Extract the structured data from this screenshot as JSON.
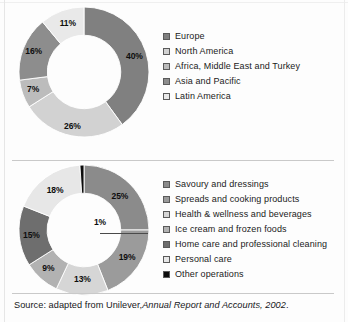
{
  "figure": {
    "source_prefix": "Source: adapted from Unilever,",
    "source_italic": "Annual Report and Accounts, 2002",
    "source_suffix": "."
  },
  "chart_data": [
    {
      "type": "pie",
      "variant": "donut",
      "title": "",
      "name": "turnover-by-region",
      "categories": [
        "Europe",
        "North America",
        "Africa, Middle East and Turkey",
        "Asia and Pacific",
        "Latin America"
      ],
      "values": [
        40,
        26,
        7,
        16,
        11
      ],
      "labels": [
        "40%",
        "26%",
        "7%",
        "16%",
        "11%"
      ],
      "colors": [
        "#808080",
        "#d2d2d2",
        "#bcbcbc",
        "#8d8d8d",
        "#e9e9e9"
      ],
      "legend_position": "right",
      "start_angle": 0,
      "direction": "clockwise",
      "hole_ratio": 0.56,
      "units": "percent"
    },
    {
      "type": "pie",
      "variant": "donut",
      "title": "",
      "name": "turnover-by-product-category",
      "categories": [
        "Savoury and dressings",
        "Spreads and cooking products",
        "Health & wellness and beverages",
        "Ice cream and frozen foods",
        "Home care and professional cleaning",
        "Personal care",
        "Other operations"
      ],
      "values": [
        25,
        19,
        13,
        9,
        15,
        18,
        1
      ],
      "labels": [
        "25%",
        "19%",
        "13%",
        "9%",
        "15%",
        "18%",
        "1%"
      ],
      "colors": [
        "#8b8b8b",
        "#9b9b9b",
        "#d6d6d6",
        "#b2b2b2",
        "#6e6e6e",
        "#e7e7e7",
        "#0c0c0c"
      ],
      "legend_position": "right",
      "start_angle": 0,
      "direction": "clockwise",
      "hole_ratio": 0.56,
      "units": "percent"
    }
  ]
}
